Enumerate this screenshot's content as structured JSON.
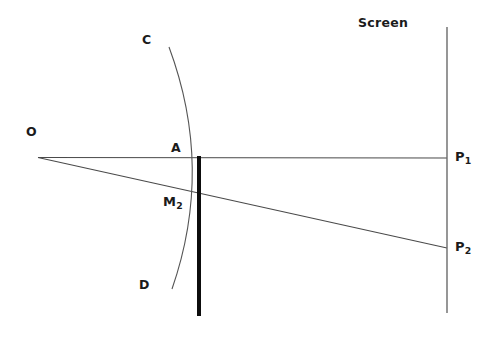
{
  "figure": {
    "kind": "optics-ray-diagram",
    "background_color": "#ffffff",
    "width": 500,
    "height": 340
  },
  "labels": {
    "screen": "Screen",
    "source": "O",
    "arc_top": "C",
    "arc_bottom": "D",
    "axis_vertex": "A",
    "mirror_point_base": "M",
    "mirror_point_sub": "2",
    "image_point1_base": "P",
    "image_point1_sub": "1",
    "image_point2_base": "P",
    "image_point2_sub": "2"
  },
  "style": {
    "ray_color": "#4a4a4a",
    "arc_color": "#555555",
    "screen_color": "#666666",
    "barrier_color": "#0d0d0d",
    "text_color": "#1b1b1b",
    "ray_width": 1,
    "arc_width": 1,
    "screen_width": 1.4,
    "barrier_width": 4
  },
  "geometry": {
    "source_point": [
      38,
      157
    ],
    "ray_upper_end": [
      447,
      158
    ],
    "ray_lower_end": [
      447,
      248
    ],
    "barrier_x": 199,
    "barrier_top_y": 157,
    "barrier_bottom_y": 316,
    "screen_x": 447,
    "screen_top_y": 27,
    "screen_bottom_y": 313,
    "arc_start": [
      169,
      47
    ],
    "arc_control": [
      213,
      170
    ],
    "arc_end": [
      172,
      289
    ],
    "vertex_A": [
      196,
      157
    ],
    "point_M2": [
      196,
      198
    ]
  }
}
